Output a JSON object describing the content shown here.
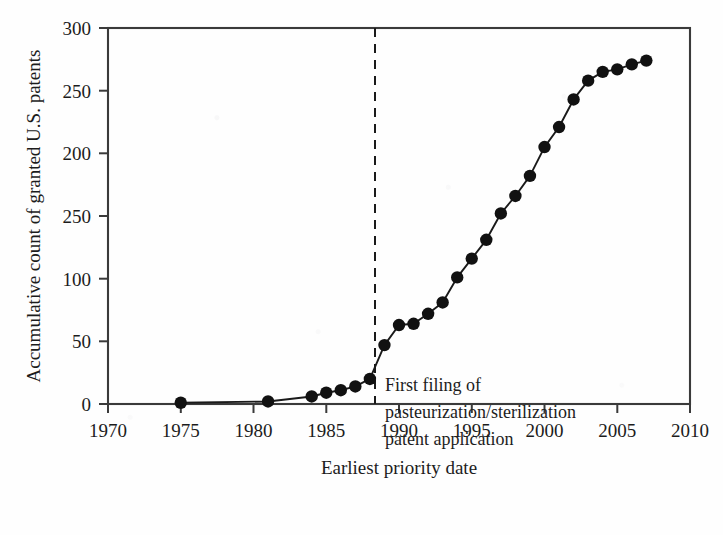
{
  "chart_data": {
    "type": "line",
    "title": "",
    "xlabel": "Earliest priority date",
    "ylabel": "Accumulative count of granted U.S. patents",
    "xlim": [
      1970,
      2010
    ],
    "ylim": [
      0,
      300
    ],
    "grid": false,
    "legend": null,
    "marker": "filled-circle",
    "line_color": "#1a1a1a",
    "marker_color": "#111111",
    "xticks": [
      1970,
      1975,
      1980,
      1985,
      1990,
      1995,
      2000,
      2005,
      2010
    ],
    "xtick_labels": [
      "1970",
      "1975",
      "1980",
      "1985",
      "1990",
      "1995",
      "2000",
      "2005",
      "2010"
    ],
    "yticks": [
      0,
      50,
      100,
      150,
      200,
      250,
      300
    ],
    "ytick_labels": [
      "0",
      "50",
      "100",
      "250",
      "200",
      "250",
      "300"
    ],
    "ytick_label_note": "The tick at value 150 is printed as '250' in the original scan (typographic error reproduced as-is).",
    "x": [
      1975,
      1981,
      1984,
      1985,
      1986,
      1987,
      1988,
      1989,
      1990,
      1991,
      1992,
      1993,
      1994,
      1995,
      1996,
      1997,
      1998,
      1999,
      2000,
      2001,
      2002,
      2003,
      2004,
      2005,
      2006,
      2007
    ],
    "values": [
      1,
      2,
      6,
      9,
      11,
      14,
      20,
      47,
      63,
      64,
      72,
      81,
      101,
      116,
      131,
      152,
      166,
      182,
      205,
      221,
      243,
      258,
      265,
      267,
      271,
      274
    ],
    "series": [
      {
        "name": "Accumulative granted U.S. patents",
        "values": [
          1,
          2,
          6,
          9,
          11,
          14,
          20,
          47,
          63,
          64,
          72,
          81,
          101,
          116,
          131,
          152,
          166,
          182,
          205,
          221,
          243,
          258,
          265,
          267,
          271,
          274
        ]
      }
    ],
    "annotations": [
      {
        "type": "vline",
        "x": 1988.3,
        "style": "dashed",
        "color": "#1a1a1a",
        "label_lines": [
          "First filing of",
          "pasteurization/sterilization",
          "patent application"
        ]
      }
    ]
  },
  "axis": {
    "x_title": "Earliest priority date",
    "y_title": "Accumulative count of granted U.S. patents"
  },
  "annotation": {
    "line1": "First filing of",
    "line2": "pasteurization/sterilization",
    "line3": "patent application"
  },
  "colors": {
    "ink": "#1a1a1a",
    "paper": "#fefefe",
    "marker": "#111111"
  }
}
